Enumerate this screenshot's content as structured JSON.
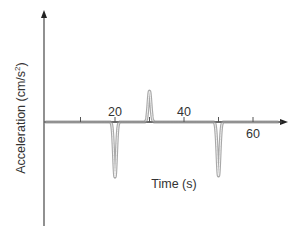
{
  "chart_data": {
    "type": "line",
    "title": "",
    "xlabel": "Time (s)",
    "ylabel": "Acceleration (cm/s²)",
    "ylabel_parts": {
      "main": "Acceleration (cm/s",
      "sup": "2",
      "end": ")"
    },
    "xlim": [
      0,
      70
    ],
    "ylim": [
      -1,
      1
    ],
    "x_ticks": [
      10,
      20,
      30,
      40,
      50,
      60
    ],
    "x_tick_labels": [
      {
        "value": 20,
        "label": "20",
        "position": "above"
      },
      {
        "value": 40,
        "label": "40",
        "position": "above"
      },
      {
        "value": 60,
        "label": "60",
        "position": "below"
      }
    ],
    "y_ticks": [],
    "grid": false,
    "legend": null,
    "y_units_note": "No y-axis tick values shown; values are relative magnitudes (trough depth = -1.0)",
    "series": [
      {
        "name": "acceleration",
        "color": "#a8a8a8",
        "baseline": 0,
        "pulses": [
          {
            "t": 20,
            "value": -1.0,
            "width_s": 1.6
          },
          {
            "t": 30,
            "value": 0.56,
            "width_s": 1.6
          },
          {
            "t": 50,
            "value": -0.98,
            "width_s": 1.6
          }
        ]
      }
    ]
  },
  "layout": {
    "origin_px": [
      46,
      122
    ],
    "px_per_second": 3.45,
    "px_per_unit_y": 55,
    "y_axis_top_px": 10,
    "y_axis_bottom_px": 226,
    "x_axis_end_px": 288,
    "axis_color": "#555555",
    "curve_color": "#a8a8a8"
  }
}
